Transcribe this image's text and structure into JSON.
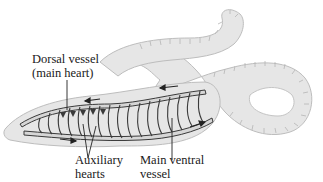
{
  "diagram": {
    "labels": {
      "dorsal_vessel": {
        "line1": "Dorsal vessel",
        "line2": "(main heart)"
      },
      "auxiliary_hearts": {
        "line1": "Auxiliary",
        "line2": "hearts"
      },
      "main_ventral_vessel": {
        "line1": "Main ventral",
        "line2": "vessel"
      }
    },
    "colors": {
      "body_fill": "#e6e6e6",
      "body_outline": "#bdbdbd",
      "segment_lines": "#b0b0b0",
      "vessel_outline": "#3a3a3a",
      "vessel_fill": "#d9d9d9",
      "leader_line": "#222222",
      "text": "#1a1a1a"
    }
  }
}
